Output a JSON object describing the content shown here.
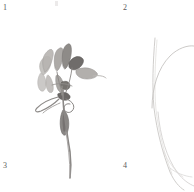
{
  "figure": {
    "width": 194,
    "height": 192,
    "background_color": "#ffffff",
    "layout": "2x2 quadrant grid, unlabelled panel borders"
  },
  "quadrants": [
    {
      "id": 1,
      "label": "1",
      "position": "top-left",
      "content": "pressed flowering plant, upper shoot with spathe-like bracts and narrow leaves"
    },
    {
      "id": 2,
      "label": "2",
      "position": "top-right",
      "content": "faint pale grass blade, near-vertical with outward arcing second blade"
    },
    {
      "id": 3,
      "label": "3",
      "position": "bottom-left",
      "content": "lower portion of same plant: swollen spindle-shaped bulb/node and long slender stem"
    },
    {
      "id": 4,
      "label": "4",
      "position": "bottom-right",
      "content": "faint pale grass blade curving down and to the right, tapering off-frame"
    }
  ],
  "marks": {
    "top_tick": "faint grey tick mark at top centre"
  },
  "palette": {
    "background": "#ffffff",
    "label_text": "#5a5a5a",
    "specimen_dark": "#6d6a68",
    "specimen_mid": "#8e8b88",
    "specimen_light": "#b4b1ae",
    "specimen_pale": "#cfcdca",
    "grass_line": "#c9c7c5",
    "tick_mark": "#eceaea"
  }
}
